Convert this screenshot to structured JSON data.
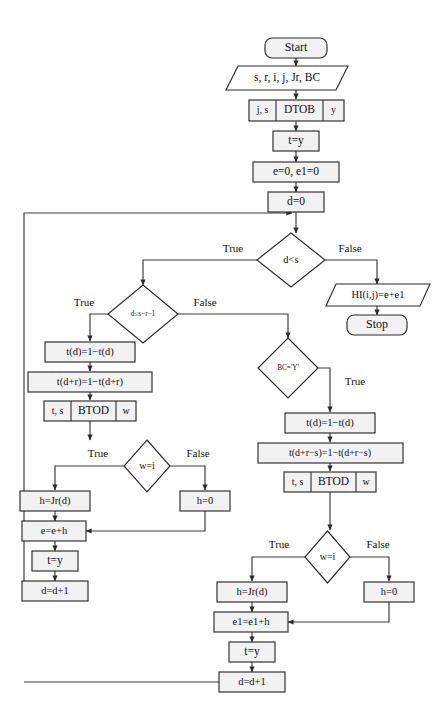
{
  "diagram": {
    "type": "flowchart",
    "colors": {
      "process_fill": "#f2f2f2",
      "decision_fill": "#ffffff",
      "io_fill": "#ffffff",
      "terminator_fill": "#f2f2f2",
      "stroke": "#2b2b2b",
      "connector": "#3a3a3a",
      "background": "#ffffff"
    },
    "nodes": {
      "start": {
        "label": "Start",
        "shape": "terminator"
      },
      "inputs": {
        "label": "s, r, i, j, Jr, BC",
        "shape": "parallelogram"
      },
      "dtob": {
        "left": "j, s",
        "center": "DTOB",
        "right": "y",
        "shape": "subroutine"
      },
      "t_eq_y_1": {
        "label": "t=y",
        "shape": "process"
      },
      "e_init": {
        "label": "e=0, e1=0",
        "shape": "process"
      },
      "d_init": {
        "label": "d=0",
        "shape": "process"
      },
      "dec_d_lt_s": {
        "label": "d<s",
        "shape": "decision"
      },
      "output_hi": {
        "label": "HI(i,j)=e+e1",
        "shape": "parallelogram"
      },
      "stop": {
        "label": "Stop",
        "shape": "terminator"
      },
      "dec_d_le": {
        "label": "d≤s−r−1",
        "shape": "decision"
      },
      "left_td": {
        "label": "t(d)=1−t(d)",
        "shape": "process"
      },
      "left_tdr": {
        "label": "t(d+r)=1−t(d+r)",
        "shape": "process"
      },
      "left_btod": {
        "left": "t, s",
        "center": "BTOD",
        "right": "w",
        "shape": "subroutine"
      },
      "left_dec_w": {
        "label": "w=i",
        "shape": "decision"
      },
      "left_h_jr": {
        "label": "h=Jr(d)",
        "shape": "process"
      },
      "left_h_zero": {
        "label": "h=0",
        "shape": "process"
      },
      "left_e_sum": {
        "label": "e=e+h",
        "shape": "process"
      },
      "left_t_eq_y": {
        "label": "t=y",
        "shape": "process"
      },
      "left_d_inc": {
        "label": "d=d+1",
        "shape": "process"
      },
      "dec_bc": {
        "label": "BC='Y'",
        "shape": "decision"
      },
      "right_td": {
        "label": "t(d)=1−t(d)",
        "shape": "process"
      },
      "right_tdrs": {
        "label": "t(d+r−s)=1−t(d+r−s)",
        "shape": "process"
      },
      "right_btod": {
        "left": "t, s",
        "center": "BTOD",
        "right": "w",
        "shape": "subroutine"
      },
      "right_dec_w": {
        "label": "w=i",
        "shape": "decision"
      },
      "right_h_jr": {
        "label": "h=Jr(d)",
        "shape": "process"
      },
      "right_h_zero": {
        "label": "h=0",
        "shape": "process"
      },
      "right_e1_sum": {
        "label": "e1=e1+h",
        "shape": "process"
      },
      "right_t_eq_y": {
        "label": "t=y",
        "shape": "process"
      },
      "right_d_inc": {
        "label": "d=d+1",
        "shape": "process"
      }
    },
    "edge_labels": {
      "d_lt_s_true": "True",
      "d_lt_s_false": "False",
      "d_le_true": "True",
      "d_le_false": "False",
      "left_w_true": "True",
      "left_w_false": "False",
      "bc_true": "True",
      "right_w_true": "True",
      "right_w_false": "False"
    }
  }
}
